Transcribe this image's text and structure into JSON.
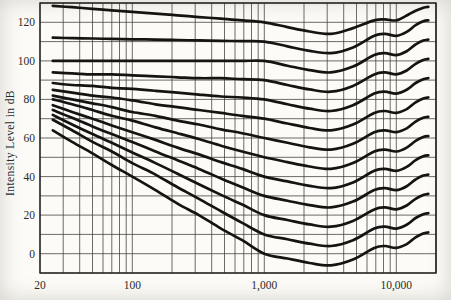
{
  "figure": {
    "background": "#fcfbf7",
    "curve_color": "#141412",
    "grid_color": "#3d3b37",
    "frame_color": "#23221f",
    "text_color": "#2b2b28"
  },
  "chart_data": {
    "type": "line",
    "title": "",
    "xlabel": "",
    "ylabel": "Intensity Level in dB",
    "x_scale": "log",
    "x_range": [
      20,
      20000
    ],
    "y_range": [
      -10,
      130
    ],
    "grid": "on",
    "grid_step_db": 10,
    "legend": "none",
    "note": "Family of 13 unlabeled equal-loudness contour curves (scanned book figure)",
    "x_ticks": [
      {
        "value": 20,
        "label": "20"
      },
      {
        "value": 100,
        "label": "100"
      },
      {
        "value": 1000,
        "label": "1,000"
      },
      {
        "value": 10000,
        "label": "10,000"
      }
    ],
    "y_ticks": [
      {
        "value": 0,
        "label": "0"
      },
      {
        "value": 20,
        "label": "20"
      },
      {
        "value": 40,
        "label": "40"
      },
      {
        "value": 60,
        "label": "60"
      },
      {
        "value": 80,
        "label": "80"
      },
      {
        "value": 100,
        "label": "100"
      },
      {
        "value": 120,
        "label": "120"
      }
    ],
    "frequencies": [
      25,
      35,
      50,
      70,
      100,
      150,
      220,
      320,
      470,
      680,
      1000,
      1500,
      2200,
      3200,
      4700,
      6800,
      8200,
      10000,
      12000,
      14000,
      16000,
      17500
    ],
    "series": [
      {
        "name": "contour-1",
        "values": [
          64,
          58,
          52,
          46,
          40,
          33,
          26,
          20,
          13,
          7,
          0,
          -2.5,
          -4.8,
          -6,
          -3,
          3,
          4,
          3,
          5,
          8.5,
          10.5,
          11
        ]
      },
      {
        "name": "contour-2",
        "values": [
          69.5,
          64,
          58,
          53,
          47,
          41,
          34.5,
          28.5,
          22,
          16,
          10,
          7.5,
          5.2,
          4,
          7,
          13,
          14,
          13,
          15,
          18.5,
          20.5,
          21
        ]
      },
      {
        "name": "contour-3",
        "values": [
          72,
          67,
          62,
          57.5,
          52.5,
          47,
          41.5,
          36,
          30.5,
          25.5,
          20,
          17.5,
          15.2,
          14,
          17,
          23,
          24,
          23,
          25,
          28.5,
          30.5,
          31
        ]
      },
      {
        "name": "contour-4",
        "values": [
          74.5,
          70.5,
          66,
          62,
          58,
          53,
          48.5,
          44,
          39,
          34.5,
          30,
          27.5,
          25.2,
          24,
          27,
          33,
          34,
          33,
          35,
          38.5,
          40.5,
          41
        ]
      },
      {
        "name": "contour-5",
        "values": [
          77,
          73.5,
          70,
          66.5,
          63,
          59,
          55,
          51.5,
          47.5,
          44,
          40,
          37.5,
          35.2,
          34,
          37,
          43,
          44,
          43,
          45,
          48.5,
          50.5,
          51
        ]
      },
      {
        "name": "contour-6",
        "values": [
          80,
          77.5,
          74.5,
          71.5,
          69,
          65.5,
          62.5,
          59.5,
          56,
          53,
          50,
          47.5,
          45.2,
          44,
          47,
          53,
          54,
          53,
          55,
          58.5,
          60.5,
          61
        ]
      },
      {
        "name": "contour-7",
        "values": [
          82,
          80,
          78,
          76,
          73.5,
          71.5,
          69,
          67,
          64.5,
          62.5,
          60,
          57.5,
          55.2,
          54,
          57,
          63,
          64,
          63,
          65,
          68.5,
          70.5,
          71
        ]
      },
      {
        "name": "contour-8",
        "values": [
          85,
          83.5,
          82,
          81,
          79.5,
          77.5,
          76,
          74.5,
          73,
          71.5,
          70,
          67.5,
          65.2,
          64,
          67,
          73,
          74,
          73,
          75,
          78.5,
          80.5,
          81
        ]
      },
      {
        "name": "contour-9",
        "values": [
          88.5,
          87.5,
          87,
          86,
          85.5,
          84.5,
          83.5,
          82.5,
          81.5,
          81,
          80,
          77.5,
          75.2,
          74,
          77,
          83,
          84,
          83,
          85,
          88.5,
          90.5,
          91
        ]
      },
      {
        "name": "contour-10",
        "values": [
          94,
          93.5,
          93,
          93,
          92.5,
          92,
          91.5,
          91,
          91,
          90.5,
          90,
          87.5,
          85.2,
          84,
          87,
          93,
          94,
          93,
          95,
          98.5,
          100.5,
          101
        ]
      },
      {
        "name": "contour-11",
        "values": [
          100,
          100,
          100,
          100,
          100,
          100,
          100,
          100,
          100,
          100,
          100,
          97.5,
          95.2,
          94,
          97,
          103,
          104,
          103,
          105,
          108.5,
          110.5,
          111
        ]
      },
      {
        "name": "contour-12",
        "values": [
          112,
          111.8,
          111.6,
          111.4,
          111.2,
          111,
          110.8,
          110.6,
          110.4,
          110.2,
          110,
          107.5,
          105.2,
          104,
          107,
          113,
          114,
          113,
          115,
          118.5,
          120.5,
          121
        ]
      },
      {
        "name": "contour-13",
        "values": [
          128.5,
          127.8,
          127,
          126.2,
          125.4,
          124.5,
          123.6,
          122.7,
          121.9,
          121,
          120,
          117.5,
          115.2,
          114,
          117,
          121,
          121.5,
          121,
          123.5,
          126,
          127.5,
          128
        ]
      }
    ]
  }
}
